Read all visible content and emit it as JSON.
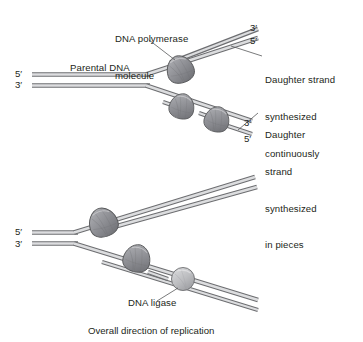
{
  "figure": {
    "title_caption": "Overall direction of replication",
    "background_color": "#ffffff",
    "text_color": "#231f20"
  },
  "colors": {
    "strand_edge": "#6d6e71",
    "strand_fill": "#d9dadb",
    "strand_edge_dark": "#58595b",
    "polymerase_fill": "#9a9ba0",
    "polymerase_edge": "#58595b",
    "ligase_fill": "#bcbdc0",
    "ligase_edge": "#6d6e71",
    "leader_line": "#58595b"
  },
  "annotations": {
    "polymerase_label_line1": "DNA polymerase",
    "polymerase_label_line2": "molecule",
    "parental_dna": "Parental DNA",
    "daughter_continuous_line1": "Daughter strand",
    "daughter_continuous_line2": "synthesized",
    "daughter_continuous_line3": "continuously",
    "daughter_pieces_line1": "Daughter",
    "daughter_pieces_line2": "strand",
    "daughter_pieces_line3": "synthesized",
    "daughter_pieces_line4": "in pieces",
    "dna_ligase": "DNA ligase"
  },
  "prime_labels": {
    "top_panel": {
      "parental_upper": "5′",
      "parental_lower": "3′",
      "leading_upper": "3′",
      "leading_lower": "5′",
      "lagging_upper": "3′",
      "lagging_lower": "5′"
    },
    "bottom_panel": {
      "parental_upper": "5′",
      "parental_lower": "3′"
    }
  },
  "diagram_data": {
    "type": "biology-diagram",
    "subject": "DNA replication fork",
    "panels": [
      {
        "name": "top-panel",
        "fork_origin_x": 148,
        "fork_origin_y": 78,
        "leading_strand": {
          "direction": "up-right",
          "angle_deg": -18,
          "synthesis": "continuous",
          "polymerase_count": 1
        },
        "lagging_strand": {
          "direction": "down-right",
          "angle_deg": 18,
          "synthesis": "in pieces",
          "polymerase_count": 2
        }
      },
      {
        "name": "bottom-panel",
        "fork_origin_x": 75,
        "fork_origin_y": 236,
        "leading_strand": {
          "direction": "up-right",
          "angle_deg": -18,
          "synthesis": "continuous",
          "polymerase_count": 1
        },
        "lagging_strand": {
          "direction": "down-right",
          "angle_deg": 18,
          "synthesis": "in pieces",
          "polymerase_count": 1,
          "ligase_count": 1
        }
      }
    ]
  }
}
